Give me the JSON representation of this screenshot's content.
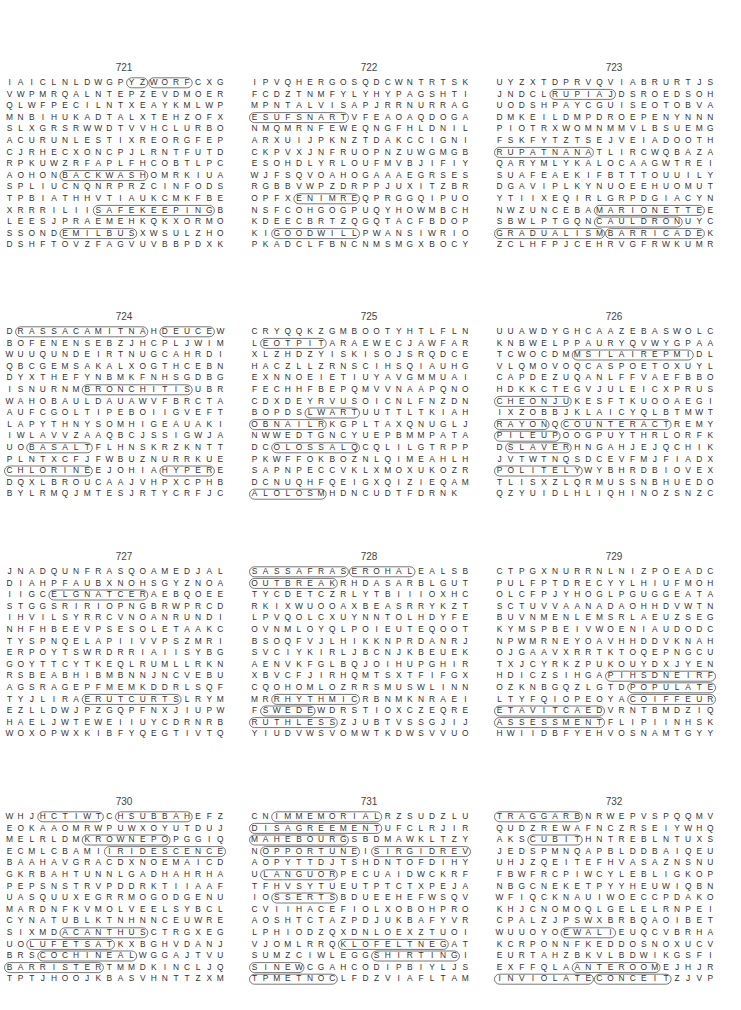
{
  "puzzles": [
    {
      "number": "721",
      "rows": [
        "IAICLNLDWGPYZWORFCXG",
        "VWPMRQALNTEPZEVDMOER",
        "QLWFPECILNTXEAYKMLWP",
        "MNBIHUKADTALXTEHZOFX",
        "SLXGRSRWWDTVVHCLURBO",
        "ACURUNLESTIXREORGFEP",
        "CJRHECXONCPJLRNTFUTD",
        "RPKUWZRFAPLFHCOBTLPC",
        "AOHONBACKWASHOMRKIUA",
        "SPLIUCNQNRPRZCINFODS",
        "TPBIATHHVTIAUKCMKFBE",
        "XRRRILIISAFEKEEPINGB",
        "LEESJPRAEMEHKQKXORMO",
        "SSONDEMILBUSXWSULZHO",
        "DSHFTOVZFAGVUVBBPDXK"
      ],
      "found_words": [
        "BACKWASH",
        "SAFEKEEPING",
        "EMILBUS",
        "WORF",
        "YZ"
      ]
    },
    {
      "number": "722",
      "rows": [
        "IPVQHERGOSQDCWNTRTSK",
        "FCDZTNMFYLYHYPAGSHTI",
        "MPNTALVISAPJRRNURRAG",
        "ESUFSNARTVFEAOAQDOGA",
        "NMQMRNFEWEQNGFHLDNIL",
        "ARXUIJPKNZTDAKCCIGNI",
        "CKPVXJNFRUOPNZUWGMGB",
        "ESOHDLYRLOUFMVBJIFIY",
        "WJFSQVOAHOGAAAEGRSES",
        "RGBBVWPZDRPPJUXITZBR",
        "OPFXENIMREQPRGGQIPUO",
        "NSFCOHGOGPUQYHOWMBCH",
        "KDEECBRTZQGQTACFBDOP",
        "KIGOODWILLPWANSIWRIO",
        "PKADCLFBNCNMSMGXBOCY"
      ],
      "found_words": [
        "ESUFSNART",
        "ENIMRE",
        "GOODWILL"
      ]
    },
    {
      "number": "723",
      "rows": [
        "UYZXTDPRVQVIABRURTJS",
        "JNDCLRUPIAJDSROEDSOH",
        "UODSHPAYCGUISEOTOBVA",
        "DMKEILDMPDROEPENYNNN",
        "PIOTRXWOMNMMVLBSUEMG",
        "FSKFYTZTSEJVEIADOOTH",
        "RUPATNANATLIRCWQBAZA",
        "QARYMLYKALOCAAGWTREI",
        "SUAFEAEKIFBTTTOUUILY",
        "DGAVIPLKYNUOEEHUOMUT",
        "YTIIXEQIRLGRPDGIACYN",
        "NWZUNCEBAMARIONETTEE",
        "SBWLPTGQNCAULDRONUYC",
        "GRADUALISMBARRICADEK",
        "ZCLHFPJCEHRVGFRWKUMR"
      ],
      "found_words": [
        "RUPIAJ",
        "RUPATNANA",
        "MARIONETTE",
        "CAULDRON",
        "GRADUALISM",
        "BARRICADE"
      ]
    },
    {
      "number": "724",
      "rows": [
        "DRASSACAMITNAHDEUCEW",
        "BOFENENSEBZJHCPLJWIM",
        "WUUQUNDEIRTNUGCAHRDI",
        "QBCGEMSAKALXOGTHCEBN",
        "DYXTHEFYNBMKFNHSGDBG",
        "ISNURNMBRONCHITISUBR",
        "WAHOBAULDAUAWVFBRCTA",
        "AUFCGOLTIPEBOIIGVEFT",
        "LAPYTHNYSOMHIGEAUAKI",
        "IWLAVVZAAQBCJSSIGWJA",
        "UOBASALTFLHNSKRZKNTT",
        "PLNTXCFJFWBUZNURRKUE",
        "CHLORINEEJOHIAHYPERE",
        "DQXLBROUCAAJVHPXCPHB",
        "BYLRMQJMTESJRTYCRFJC"
      ],
      "found_words": [
        "RASSACAMITNA",
        "DEUCE",
        "BRONCHITIS",
        "BASALT",
        "CHLORINE",
        "HYPER"
      ]
    },
    {
      "number": "725",
      "rows": [
        "CRYQQKZGMBOOTYHTLFLN",
        "LEOTPITARAEWECJAWFAR",
        "XLZHDZYISKISOJSRQDCE",
        "HACZLLZRNSCIHSQIAUHG",
        "EXNNOEIETIUYAVGMMUAI",
        "FECHHFBEPQMVVNAAPQNO",
        "CDXDEYRVUSOICNLFNZDN",
        "BOPDSLWARTUUTTLTKIA",
        "HOBNAILRKGPLTAXQNUGL",
        "JNWWEDTGNCYUEPBMMPAT",
        "ADCOLOSSALQCQLILGTRP",
        "PPKWFFOKBOZNLQIMEAHL",
        "HSAPNPECCVKLXMOXUKOZ",
        "RDCNUQHFQEIGXQIZIEQA",
        "MALOLOSMHDNCUDTFDRNK"
      ],
      "found_words": [
        "EOTPIT",
        "LWART",
        "HOBNAIL",
        "COLOSSAL",
        "MALOLOS"
      ]
    },
    {
      "number": "726",
      "rows": [
        "UUAWDYGHCAAZEBASWOLC",
        "KNBWELPPAURYQVWYGPAA",
        "TCWOCDMMSILAIREPMIDL",
        "VLQMOVOQCASPOETOXUYL",
        "CAPDEZUQANLFFVAEFBBO",
        "HDKKCTEGVJULEICXPRUS",
        "CHEONJUKESFTKUOOAEGI",
        "IXZOBBJKLAICYQLBTMWT",
        "RAYONQCOUNTERACTREMY",
        "PILEUPOOGPUYTHRLORFK",
        "DSLAVERHNGAHJEJQCHIK",
        "JVTWTNQSDCEVFMJFIADX",
        "POLITELYWYBHRDBIOVEX",
        "TLISXZLQRMUSSNBHUEDO",
        "QZYUIDLHLIQHINOZSNZC"
      ],
      "found_words": [
        "MSILAIREPMI",
        "CHEONJU",
        "RAYON",
        "COUNTERACT",
        "PILEUP",
        "SLAVER",
        "POLITELY"
      ]
    },
    {
      "number": "727",
      "rows": [
        "JNADQUNFRASQOAMEDJAL",
        "DIAHPFAUBXNOHSGYZNOA",
        "IIGCELGNATCERAEBQOEE",
        "STGGSRIRIOPNGBRWPRCD",
        "IHVILSYRRCVNOANRUNDI",
        "NHFHBEEVPSESOLETAAKC",
        "TYSPNQELAPIIVVPSZMRI",
        "ERPOYTSWRDRRIAIISYBG",
        "GOYTTCYTKEQLRUMLLRKN",
        "RSBEABHIBMBNNJNCVEBU",
        "AGSRAGEPFMEMKDDRLSQF",
        "TYJLIRAERUTCURTSLRYM",
        "EZLLDWJPZGQPFNXJIUPW",
        "HAELJWTEWEIIUYCDRNRB",
        "WOXOPWXKIBFYQEGTIVTQ"
      ],
      "found_words": [
        "ELGNATCER",
        "ERUTCURTS"
      ]
    },
    {
      "number": "728",
      "rows": [
        "SASSAFRASEROHALEALSB",
        "OUTBREAKRHDASARBLGUT",
        "TYCDETCZRLYTBIIIOXHC",
        "RKIXWUOOAXBEASRRYKZT",
        "LPVQOLCXUYNNTOLHDYFE",
        "OVNMLOYQLPOIEUTEQOOT",
        "BSOQFVJLHIKKNPRDANRJ",
        "SVCIYKIRLJBCNJKBEUEK",
        "AENVKFGLBQJOIHUPGHIR",
        "XBVCFJIRHQMTSXTFIFGX",
        "CQOHOMLOZRRSMUSWLINN",
        "MRRHYTHMICRBNMKNRAEI",
        "FSWEDEWDRSTIOXCZEQRE",
        "RUTHLESSZJUBTVSSGJIJ",
        "YIUDVWSVOMWTKDWSVVUO"
      ],
      "found_words": [
        "SASSAFRAS",
        "EROHAL",
        "OUTBREAK",
        "RHYTHMIC",
        "SWEDE",
        "RUTHLESS"
      ]
    },
    {
      "number": "729",
      "rows": [
        "CTPGXNURRNLNIZPOEADC",
        "PULFPTDRECYYLHIUFMOH",
        "OLCFPJYHOGLPGUGGEATA",
        "SCTUVVAANADAOHHDVWTN",
        "BUVNMENLEMSRLAEUZSEG",
        "KYMSPBEIVWOENIAUDODC",
        "NPWMRNEYOAVHHDDVKNAH",
        "OJGAAVXRRTKTOQEPNGCU",
        "TXJCYRKZPUKOUYDXJYEN",
        "HDICZSIHGAPIHSDNEIRF",
        "OZKNBGQZLGTDPOPULATE",
        "LTYFQIOPEOYACOIFFEUR",
        "ETAVITCAEDVRNTBMDZIQ",
        "ASSESSMENTFLIPIINHSK",
        "HWIIDBFYEHVOSNAMTGYY"
      ],
      "found_words": [
        "PIHSDNEIRF",
        "POPULATE",
        "COIFFEUR",
        "ETAVITCAED",
        "ASSESSMENT"
      ]
    },
    {
      "number": "730",
      "rows": [
        "WHJHCTIWTCHSUBBAHEFZ",
        "EOKAAOMRWPUWXOYUTDUJ",
        "MELRLDMKROWNEPOPGGIQ",
        "ECMLCBAMIIRIDESCENCE",
        "BAAHAVGRACDXNOEMAICD",
        "GKRBAHTUNNLGADHAHRHA",
        "PEPSNSTRVPDDRKTIIAAF",
        "UASQUUXEGRRMOGODGENU",
        "MARDNFKVMOLVEELSYBCL",
        "CYNATUBLKTNHNNCEUWRE",
        "SIXMDACANTHUSCTRGXEG",
        "UOLUFETSATKXBGHVDANJ",
        "BRSCOCHINEALWGGAJTVU",
        "BARRISTERTMMDKINCLJQ",
        "TPTJHOOJKBASVHNTTZXM"
      ],
      "found_words": [
        "HCTIWT",
        "HSUBBAH",
        "KROWNEPO",
        "IRIDESCENCE",
        "ACANTHUS",
        "LUFETSAT",
        "COCHINEAL",
        "BARRISTER"
      ]
    },
    {
      "number": "731",
      "rows": [
        "CNIMMEMORIALRZSUDZLU",
        "DISAGREEMENTUFCLRJIR",
        "MAHEBOURGSBDMAWKLTZY",
        "NOPPORTUNEISIRGIDREV",
        "AOPYTTDJTSHDNTOFDIHY",
        "ULANGUORPECUAIDWCKRF",
        "TFHVSYTUEUTPTCTXPEJA",
        "IOSSERTSBDUEEHEFWSQV",
        "CVIIHACEFIOLXOBOHPRO",
        "AOSHTCTAZPDJUKBAFYVR",
        "LPHIODZQXDNLOEXZTUOI",
        "VJOMLRRQKLOFELTNEGAT",
        "SUMZCIWLEGGSHIRTINGI",
        "SINEWCGAHCODIPBIYLJS",
        "TPMETNOCLFDZVIAFLTAM"
      ],
      "found_words": [
        "IMMEMORIAL",
        "DISAGREEMENT",
        "MAHEBOURG",
        "OPPORTUNE",
        "SIRGIDREV",
        "LANGUOR",
        "SSERTS",
        "KLOFELTNEG",
        "SHIRTING",
        "SINEW",
        "TPMETNOC"
      ]
    },
    {
      "number": "732",
      "rows": [
        "TRAGGARBNRWEPVSPQQMV",
        "QUDZREWAFNCZRSEIYWHQ",
        "AKSCUBITHNTREBLNTUXS",
        "JEDSPMNQAPBLDDBAIQEU",
        "UHJZQEITEFHVASAZNSNU",
        "FBWFRCPIWCYLEBLIGKOP",
        "NBGCNEKETPYYHEUWIQBN",
        "WFIQCKNAUIWOECCPDAKO",
        "KHJCNOMOQLGELELRNPEI",
        "CPALZJPSWXBRBQAOIBET",
        "WUUOYOEWALIEUQCVBRHA",
        "KCRPONNFKEDDOSNOXUCV",
        "EURTAHZBKVLBDWIKGSFI",
        "EXFFQLAANTEROOMEJHJR",
        "INVIOLATECONCEITZJVP"
      ],
      "found_words": [
        "TRAGGARB",
        "CUBIT",
        "EWALI",
        "ANTEROOM",
        "INVIOLATE",
        "CONCEIT"
      ]
    }
  ]
}
